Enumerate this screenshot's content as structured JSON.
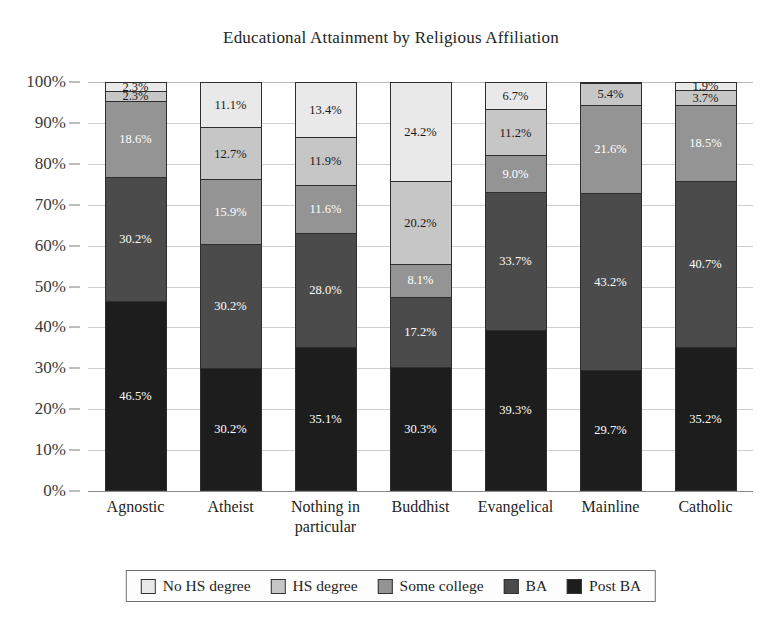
{
  "chart_data": {
    "type": "bar",
    "subtype": "stacked-100-percent",
    "title": "Educational Attainment by Religious Affiliation",
    "xlabel": "",
    "ylabel": "",
    "ylim": [
      0,
      100
    ],
    "y_tick_labels": [
      "100%",
      "90%",
      "80%",
      "70%",
      "60%",
      "50%",
      "40%",
      "30%",
      "20%",
      "10%",
      "0%"
    ],
    "y_tick_values": [
      100,
      90,
      80,
      70,
      60,
      50,
      40,
      30,
      20,
      10,
      0
    ],
    "grid": true,
    "legend_position": "bottom",
    "categories": [
      "Agnostic",
      "Atheist",
      "Nothing in particular",
      "Buddhist",
      "Evangelical",
      "Mainline",
      "Catholic"
    ],
    "category_lines": [
      [
        "Agnostic"
      ],
      [
        "Atheist"
      ],
      [
        "Nothing in",
        "particular"
      ],
      [
        "Buddhist"
      ],
      [
        "Evangelical"
      ],
      [
        "Mainline"
      ],
      [
        "Catholic"
      ]
    ],
    "series": [
      {
        "name": "No HS degree",
        "color": "#e9e9e9",
        "label_color": "#1a1a1a",
        "values": [
          2.3,
          11.1,
          13.4,
          24.2,
          6.7,
          0.1,
          1.9
        ],
        "labels": [
          "2.3%",
          "11.1%",
          "13.4%",
          "24.2%",
          "6.7%",
          "",
          "1.9%"
        ]
      },
      {
        "name": "HS degree",
        "color": "#c6c6c6",
        "label_color": "#1a1a1a",
        "values": [
          2.3,
          12.7,
          11.9,
          20.2,
          11.2,
          5.4,
          3.7
        ],
        "labels": [
          "2.3%",
          "12.7%",
          "11.9%",
          "20.2%",
          "11.2%",
          "5.4%",
          "3.7%"
        ]
      },
      {
        "name": "Some college",
        "color": "#949494",
        "label_color": "#ffffff",
        "values": [
          18.6,
          15.9,
          11.6,
          8.1,
          9.0,
          21.6,
          18.5
        ],
        "labels": [
          "18.6%",
          "15.9%",
          "11.6%",
          "8.1%",
          "9.0%",
          "21.6%",
          "18.5%"
        ]
      },
      {
        "name": "BA",
        "color": "#4b4b4b",
        "label_color": "#ffffff",
        "values": [
          30.2,
          30.2,
          28.0,
          17.2,
          33.7,
          43.2,
          40.7
        ],
        "labels": [
          "30.2%",
          "30.2%",
          "28.0%",
          "17.2%",
          "33.7%",
          "43.2%",
          "40.7%"
        ]
      },
      {
        "name": "Post BA",
        "color": "#1d1d1d",
        "label_color": "#ffffff",
        "values": [
          46.5,
          30.2,
          35.1,
          30.3,
          39.3,
          29.7,
          35.2
        ],
        "labels": [
          "46.5%",
          "30.2%",
          "35.1%",
          "30.3%",
          "39.3%",
          "29.7%",
          "35.2%"
        ]
      }
    ]
  }
}
